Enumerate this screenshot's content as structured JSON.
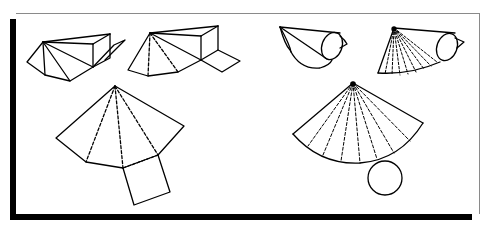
{
  "colors": {
    "stroke": "#000000",
    "background": "#ffffff",
    "frame_border": "#8a8a8a",
    "frame_shadow": "#000000"
  },
  "figures": [
    {
      "id": "pyramid-folding-1",
      "label": "Pyramid net partially folded (solid)"
    },
    {
      "id": "pyramid-folding-2",
      "label": "Pyramid net partially unfolded (dashed fold lines)"
    },
    {
      "id": "pyramid-net",
      "label": "Pyramid flat net with square base"
    },
    {
      "id": "cone-folding-1",
      "label": "Cone partially folded"
    },
    {
      "id": "cone-folding-2",
      "label": "Cone partially unfolded (dashed rays)"
    },
    {
      "id": "cone-net",
      "label": "Cone flat net (sector) with circular base"
    }
  ]
}
